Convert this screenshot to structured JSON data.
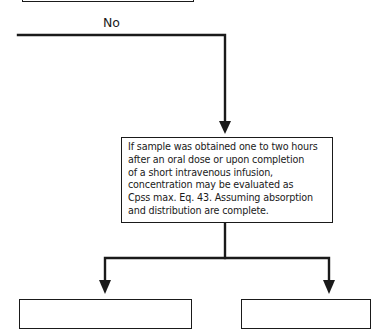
{
  "diagram": {
    "branch_label": "No",
    "decision_box": {
      "lines": [
        "If sample was obtained one to two hours",
        "after an oral dose or upon completion",
        "of a short intravenous infusion,",
        "concentration may be evaluated as",
        "Cpss max. Eq. 43. Assuming absorption",
        "and distribution are complete."
      ]
    },
    "colors": {
      "line": "#1a1a1a",
      "background": "#ffffff"
    }
  }
}
